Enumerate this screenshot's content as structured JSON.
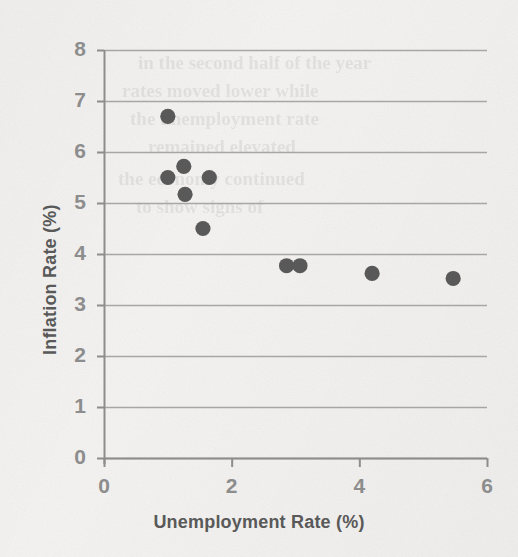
{
  "chart_data": {
    "type": "scatter",
    "title": "",
    "xlabel": "Unemployment Rate (%)",
    "ylabel": "Inflation Rate (%)",
    "xlim": [
      0,
      6
    ],
    "ylim": [
      0,
      8
    ],
    "xticks": [
      "0",
      "2",
      "4",
      "6"
    ],
    "xtick_values": [
      0,
      2,
      4,
      6
    ],
    "yticks": [
      "0",
      "1",
      "2",
      "3",
      "4",
      "5",
      "6",
      "7",
      "8"
    ],
    "ytick_values": [
      0,
      1,
      2,
      3,
      4,
      5,
      6,
      7,
      8
    ],
    "grid": "horizontal",
    "legend": "none",
    "marker": "filled-circle",
    "marker_color": "#595959",
    "gridline_color": "#a6a6a6",
    "axis_color": "#8d8d8d",
    "series": [
      {
        "name": "Unemployment vs Inflation",
        "points": [
          {
            "x": 1.0,
            "y": 6.7
          },
          {
            "x": 1.0,
            "y": 5.5
          },
          {
            "x": 1.25,
            "y": 5.72
          },
          {
            "x": 1.27,
            "y": 5.17
          },
          {
            "x": 1.65,
            "y": 5.5
          },
          {
            "x": 1.55,
            "y": 4.5
          },
          {
            "x": 2.86,
            "y": 3.77
          },
          {
            "x": 3.07,
            "y": 3.77
          },
          {
            "x": 4.2,
            "y": 3.62
          },
          {
            "x": 5.47,
            "y": 3.52
          }
        ]
      }
    ]
  },
  "bleed_through": {
    "lines": [
      {
        "text": "in the second half of the year",
        "x": 138,
        "y": 52,
        "size": 19
      },
      {
        "text": "rates moved lower while",
        "x": 122,
        "y": 80,
        "size": 19
      },
      {
        "text": "the unemployment rate",
        "x": 130,
        "y": 108,
        "size": 19
      },
      {
        "text": "remained elevated",
        "x": 148,
        "y": 136,
        "size": 19
      },
      {
        "text": "the economy continued",
        "x": 118,
        "y": 168,
        "size": 19
      },
      {
        "text": "to show signs of",
        "x": 136,
        "y": 196,
        "size": 19
      }
    ]
  }
}
